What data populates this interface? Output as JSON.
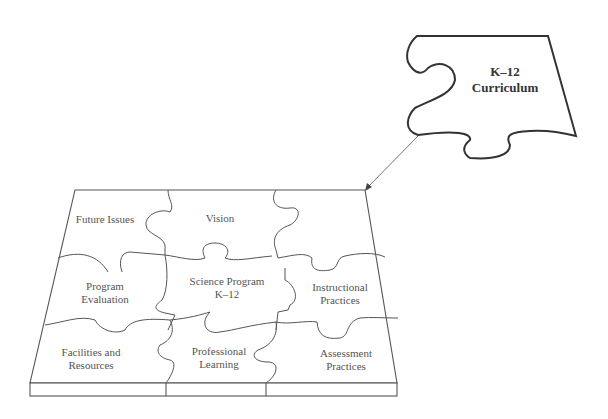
{
  "diagram": {
    "type": "jigsaw-puzzle",
    "detached_piece": {
      "line1": "K–12",
      "line2": "Curriculum"
    },
    "board_pieces": [
      {
        "id": "future-issues",
        "line1": "Future Issues",
        "line2": ""
      },
      {
        "id": "vision",
        "line1": "Vision",
        "line2": ""
      },
      {
        "id": "program-evaluation",
        "line1": "Program",
        "line2": "Evaluation"
      },
      {
        "id": "science-program",
        "line1": "Science Program",
        "line2": "K–12"
      },
      {
        "id": "instructional-practices",
        "line1": "Instructional",
        "line2": "Practices"
      },
      {
        "id": "facilities-resources",
        "line1": "Facilities and",
        "line2": "Resources"
      },
      {
        "id": "professional-learning",
        "line1": "Professional",
        "line2": "Learning"
      },
      {
        "id": "assessment-practices",
        "line1": "Assessment",
        "line2": "Practices"
      }
    ],
    "arrow": {
      "from": "detached_piece",
      "to": "board-top-right-corner"
    },
    "colors": {
      "line": "#555555",
      "piece_outline": "#333333",
      "text": "#555555"
    }
  }
}
